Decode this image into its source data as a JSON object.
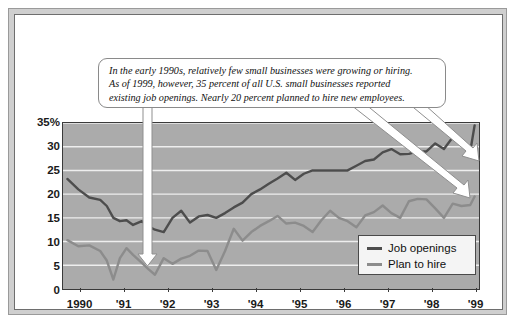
{
  "figure": {
    "callout_text_lines": [
      "In the early 1990s, relatively few small businesses were growing or hiring.",
      "As of 1999, however, 35 percent of all U.S. small businesses reported",
      "existing job openings. Nearly 20 percent planned to hire new employees."
    ]
  },
  "colors": {
    "plot_background": "#ababab",
    "gridline": "#eeeeee",
    "job_openings": "#4d4d4d",
    "plan_to_hire": "#8c8c8c",
    "axis": "#3a3a3a",
    "page_background": "#ffffff",
    "frame_outer": "#cfcfcf",
    "callout_fill": "#ffffff",
    "arrow_fill": "#ffffff"
  },
  "chart_data": {
    "type": "line",
    "title": "",
    "subtitle": "",
    "xlabel": "",
    "ylabel": "",
    "ylim": [
      0,
      35
    ],
    "xlim": [
      1989.6,
      1999.1
    ],
    "grid": true,
    "legend_position": "bottom-right",
    "ytick_labels": [
      "0",
      "5",
      "10",
      "15",
      "20",
      "25",
      "30",
      "35%"
    ],
    "ytick_values": [
      0,
      5,
      10,
      15,
      20,
      25,
      30,
      35
    ],
    "xtick_labels": [
      "1990",
      "'91",
      "'92",
      "'93",
      "'94",
      "'95",
      "'96",
      "'97",
      "'98",
      "'99"
    ],
    "xtick_values": [
      1990,
      1991,
      1992,
      1993,
      1994,
      1995,
      1996,
      1997,
      1998,
      1999
    ],
    "annotations": [
      {
        "text": "In the early 1990s, relatively few small businesses were growing or hiring. As of 1999, however, 35 percent of all U.S. small businesses reported existing job openings. Nearly 20 percent planned to hire new employees.",
        "points_to": [
          "1991.5 (low point)",
          "1999 job openings 35",
          "1999 plan to hire 19.5"
        ]
      }
    ],
    "x": [
      1989.7,
      1989.95,
      1990.2,
      1990.45,
      1990.6,
      1990.75,
      1990.9,
      1991.05,
      1991.2,
      1991.4,
      1991.55,
      1991.7,
      1991.9,
      1992.1,
      1992.3,
      1992.5,
      1992.7,
      1992.9,
      1993.1,
      1993.3,
      1993.5,
      1993.7,
      1993.9,
      1994.1,
      1994.3,
      1994.5,
      1994.7,
      1994.9,
      1995.1,
      1995.3,
      1995.5,
      1995.7,
      1995.9,
      1996.1,
      1996.3,
      1996.5,
      1996.7,
      1996.9,
      1997.1,
      1997.3,
      1997.5,
      1997.7,
      1997.9,
      1998.1,
      1998.3,
      1998.5,
      1998.7,
      1998.9,
      1999.0
    ],
    "series": [
      {
        "name": "Job openings",
        "color": "#4d4d4d",
        "values": [
          23.2,
          21.0,
          19.3,
          18.8,
          17.5,
          15.0,
          14.3,
          14.5,
          13.5,
          14.3,
          13.2,
          12.5,
          12.0,
          15.0,
          16.5,
          14.0,
          15.3,
          15.6,
          15.0,
          16.0,
          17.2,
          18.2,
          20.0,
          21.0,
          22.2,
          23.3,
          24.5,
          23.0,
          24.3,
          25.0,
          25.0,
          25.0,
          25.0,
          25.0,
          26.0,
          27.0,
          27.3,
          28.8,
          29.5,
          28.4,
          28.5,
          29.0,
          29.0,
          30.7,
          29.5,
          32.0,
          30.3,
          29.0,
          34.5
        ]
      },
      {
        "name": "Plan to hire",
        "color": "#8c8c8c",
        "values": [
          10.3,
          9.0,
          9.2,
          8.0,
          6.0,
          2.0,
          6.5,
          8.6,
          7.2,
          5.5,
          4.2,
          3.0,
          6.5,
          5.3,
          6.4,
          7.0,
          8.1,
          8.0,
          4.0,
          8.0,
          12.7,
          10.2,
          12.0,
          13.3,
          14.3,
          15.4,
          13.8,
          14.0,
          13.3,
          12.0,
          14.5,
          16.5,
          15.0,
          14.3,
          13.0,
          15.5,
          16.2,
          17.6,
          16.0,
          15.0,
          18.5,
          19.0,
          18.9,
          17.0,
          15.0,
          18.0,
          17.5,
          17.7,
          19.5
        ]
      }
    ]
  },
  "legend": {
    "items": [
      {
        "label": "Job openings",
        "color": "#4d4d4d"
      },
      {
        "label": "Plan to hire",
        "color": "#8c8c8c"
      }
    ]
  }
}
